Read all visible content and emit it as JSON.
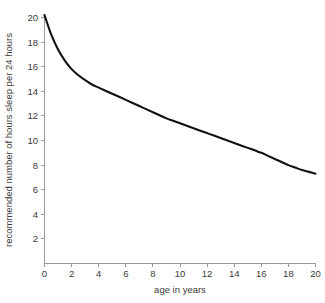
{
  "chart_data": {
    "type": "line",
    "title": "",
    "xlabel": "age in years",
    "ylabel": "recommended number of hours sleep per 24 hours",
    "xlim": [
      0,
      20
    ],
    "ylim": [
      0,
      20
    ],
    "xticks": [
      0,
      2,
      4,
      6,
      8,
      10,
      12,
      14,
      16,
      18,
      20
    ],
    "xtick_labels": [
      "0",
      "2",
      "4",
      "6",
      "8",
      "10",
      "12",
      "14",
      "16",
      "18",
      "20"
    ],
    "yticks": [
      2,
      4,
      6,
      8,
      10,
      12,
      14,
      16,
      18,
      20
    ],
    "ytick_labels": [
      "2",
      "4",
      "6",
      "8",
      "10",
      "12",
      "14",
      "16",
      "18",
      "20"
    ],
    "grid": false,
    "legend": false,
    "series": [
      {
        "name": "recommended sleep",
        "color": "#111111",
        "x": [
          0,
          0.5,
          1,
          1.5,
          2,
          2.5,
          3,
          3.5,
          4,
          4.5,
          5,
          5.5,
          6,
          6.5,
          7,
          7.5,
          8,
          8.5,
          9,
          9.5,
          10,
          10.5,
          11,
          11.5,
          12,
          12.5,
          13,
          13.5,
          14,
          14.5,
          15,
          15.5,
          16,
          16.5,
          17,
          17.5,
          18,
          18.5,
          19,
          19.5,
          20
        ],
        "values": [
          20.2,
          18.6,
          17.4,
          16.5,
          15.8,
          15.3,
          14.9,
          14.55,
          14.3,
          14.05,
          13.8,
          13.55,
          13.3,
          13.05,
          12.8,
          12.55,
          12.3,
          12.05,
          11.8,
          11.6,
          11.4,
          11.2,
          11.0,
          10.8,
          10.6,
          10.4,
          10.2,
          10.0,
          9.8,
          9.6,
          9.4,
          9.2,
          9.0,
          8.75,
          8.5,
          8.25,
          8.0,
          7.8,
          7.6,
          7.45,
          7.3
        ]
      }
    ]
  },
  "axes": {
    "x_title": "age in years",
    "y_title": "recommended number of hours sleep per 24 hours"
  }
}
